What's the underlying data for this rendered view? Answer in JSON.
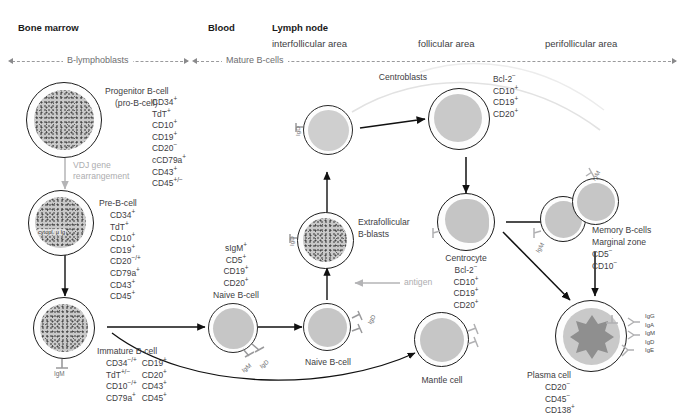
{
  "figure": {
    "compartments": [
      {
        "name": "Bone marrow"
      },
      {
        "name": "Blood"
      },
      {
        "name": "Lymph node"
      }
    ],
    "lymph_node_areas": [
      "interfollicular area",
      "follicular area",
      "perifollicular area"
    ],
    "tracks": [
      {
        "label": "B-lymphoblasts"
      },
      {
        "label": "Mature B-cells"
      }
    ]
  },
  "cells": {
    "progenitor": {
      "name": "Progenitor B-cell",
      "alias": "(pro-B-cell)",
      "markers": [
        "CD34+",
        "TdT+",
        "CD10+",
        "CD19+",
        "CD20-",
        "cCD79a+",
        "CD43+",
        "CD45+/-"
      ]
    },
    "pre_b": {
      "name": "Pre-B-cell",
      "inner_label": "cytopl. μ Ig",
      "markers": [
        "CD34+",
        "TdT+",
        "CD10+",
        "CD19+",
        "CD20-/+",
        "CD79a+",
        "CD43+",
        "CD45+"
      ]
    },
    "immature": {
      "name": "Immature B-cell",
      "surface": [
        "IgM"
      ],
      "markers_col1": [
        "CD34-/+",
        "TdT+/-",
        "CD10-/+",
        "CD79a+"
      ],
      "markers_col2": [
        "CD19+",
        "CD20+",
        "CD43+",
        "CD45+"
      ]
    },
    "naive_blood": {
      "name": "Naive B-cell",
      "surface": [
        "IgM",
        "IgD"
      ],
      "markers": [
        "sIgM+",
        "CD5+",
        "CD19+",
        "CD20+"
      ]
    },
    "naive_node": {
      "name": "Naive B-cell",
      "surface": [
        "IgM",
        "IgD"
      ]
    },
    "naive_upper": {
      "name": "",
      "surface": [
        "IgD"
      ]
    },
    "extrafollicular": {
      "name": "Extrafollicular",
      "name2": "B-blasts",
      "surface": [
        "IgD"
      ]
    },
    "centroblasts": {
      "name": "Centroblasts",
      "markers": [
        "Bcl-2-",
        "CD10+",
        "CD19+",
        "CD20+"
      ]
    },
    "centrocyte": {
      "name": "Centrocyte",
      "markers": [
        "Bcl-2-",
        "CD10+",
        "CD19+",
        "CD20+"
      ]
    },
    "memory": {
      "name": "Memory B-cells",
      "subtitle": "Marginal zone",
      "surface": [
        "IgM"
      ],
      "markers": [
        "CD5-",
        "CD10-"
      ]
    },
    "mantle": {
      "name": "Mantle cell",
      "surface": [
        "IgM",
        "IgD"
      ]
    },
    "plasma": {
      "name": "Plasma cell",
      "markers": [
        "CD20-",
        "CD45-",
        "CD138+"
      ],
      "immunoglobulins": [
        "IgG",
        "IgA",
        "IgM",
        "IgD",
        "IgE"
      ]
    }
  },
  "annotations": {
    "vdj": "VDJ gene",
    "vdj2": "rearrangement",
    "antigen": "antigen"
  },
  "colors": {
    "text": "#3d3d3f",
    "heading": "#1a1a1a",
    "gray_annotation": "#adadaf",
    "cell_fill": "#c6c6c6",
    "arrow": "#1d1d1d"
  }
}
